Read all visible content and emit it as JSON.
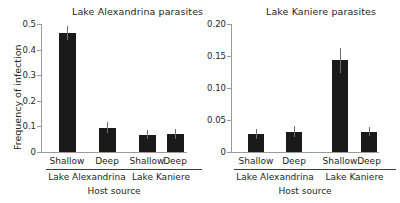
{
  "figure": {
    "ylabel": "Frequency of infection",
    "xlabel_left": "Host source",
    "xlabel_right": "Host source"
  },
  "chart_data": [
    {
      "type": "bar",
      "title": "Lake Alexandrina parasites",
      "xlabel": "Host source",
      "ylabel": "Frequency of infection",
      "ylim": [
        0,
        0.5
      ],
      "yticks": [
        0,
        0.1,
        0.2,
        0.3,
        0.4,
        0.5
      ],
      "ytick_labels": [
        "0",
        "0.1",
        "0.2",
        "0.3",
        "0.4",
        "0.5"
      ],
      "grid": false,
      "legend": "none",
      "categories": [
        "Shallow",
        "Deep",
        "Shallow",
        "Deep"
      ],
      "groups": [
        {
          "label": "Lake Alexandrina",
          "categories": [
            "Shallow",
            "Deep"
          ]
        },
        {
          "label": "Lake Kaniere",
          "categories": [
            "Shallow",
            "Deep"
          ]
        }
      ],
      "values": [
        0.465,
        0.095,
        0.068,
        0.071
      ],
      "errors": [
        0.028,
        0.022,
        0.018,
        0.019
      ],
      "bar_color": "#1a1a1a"
    },
    {
      "type": "bar",
      "title": "Lake Kaniere parasites",
      "xlabel": "Host source",
      "ylabel": "",
      "ylim": [
        0,
        0.2
      ],
      "yticks": [
        0,
        0.05,
        0.1,
        0.15,
        0.2
      ],
      "ytick_labels": [
        "0",
        "0.05",
        "0.10",
        "0.15",
        "0.20"
      ],
      "grid": false,
      "legend": "none",
      "categories": [
        "Shallow",
        "Deep",
        "Shallow",
        "Deep"
      ],
      "groups": [
        {
          "label": "Lake Alexandrina",
          "categories": [
            "Shallow",
            "Deep"
          ]
        },
        {
          "label": "Lake Kaniere",
          "categories": [
            "Shallow",
            "Deep"
          ]
        }
      ],
      "values": [
        0.028,
        0.032,
        0.143,
        0.032
      ],
      "errors": [
        0.008,
        0.009,
        0.02,
        0.007
      ],
      "bar_color": "#1a1a1a"
    }
  ]
}
